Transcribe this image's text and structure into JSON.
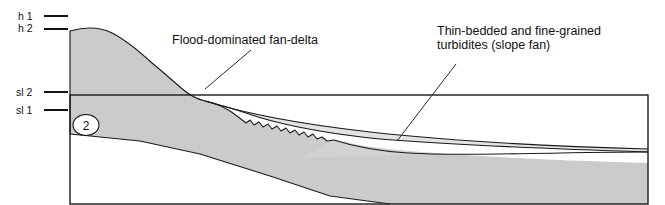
{
  "figure": {
    "width": 665,
    "height": 205,
    "background": "#ffffff"
  },
  "axis_labels": [
    {
      "id": "h1",
      "text": "h 1",
      "text_x": 18,
      "text_y": 20,
      "tick_x1": 44,
      "tick_x2": 68,
      "tick_y": 16
    },
    {
      "id": "h2",
      "text": "h 2",
      "text_x": 18,
      "text_y": 32,
      "tick_x1": 44,
      "tick_x2": 68,
      "tick_y": 29
    },
    {
      "id": "sl2",
      "text": "sl 2",
      "text_x": 16,
      "text_y": 96,
      "tick_x1": 44,
      "tick_x2": 68,
      "tick_y": 92
    },
    {
      "id": "sl1",
      "text": "sl 1",
      "text_x": 16,
      "text_y": 114,
      "tick_x1": 44,
      "tick_x2": 68,
      "tick_y": 110
    }
  ],
  "annotations": [
    {
      "id": "fan-delta",
      "lines": [
        "Flood-dominated fan-delta"
      ],
      "x": 172,
      "y": 44,
      "leader": {
        "x1": 251,
        "y1": 50,
        "x2": 205,
        "y2": 89
      }
    },
    {
      "id": "slope-fan",
      "lines": [
        "Thin-bedded and fine-grained",
        "turbidites (slope fan)"
      ],
      "x": 437,
      "y": 35,
      "leader": {
        "x1": 456,
        "y1": 64,
        "x2": 397,
        "y2": 141
      }
    }
  ],
  "stage_marker": {
    "label": "2",
    "cx": 86,
    "cy": 125,
    "rx": 13,
    "ry": 10.5
  },
  "sea_box": {
    "x": 70,
    "y": 95,
    "width": 578,
    "height": 109
  },
  "colors": {
    "basement_fill": "#cbcbcb",
    "fan_delta_fill": "#ffffff",
    "slope_fan_fill": "#e3e3e3",
    "lower_wedge_fill": "#d2d2d2",
    "outline": "#1a1a1a",
    "text": "#111111"
  },
  "geometry": {
    "basement": "M 70,31 C 84,27 100,27 112,33 C 126,40 140,52 152,63 C 163,72 172,80 180,87 C 189,95 196,99 205,101 C 214,103 222,106 230,111 C 236,115 241,119 246,123 L 250,120 L 254,125 L 259,122 L 263,127 L 268,124 L 272,129 L 277,126 L 281,131 L 286,128 L 290,133 L 295,130 L 299,135 L 304,132 L 308,137 L 313,134 L 317,139 L 322,137 L 327,141 L 334,140 L 345,142 L 360,145 L 380,148 L 410,151 L 450,154 L 500,157 L 560,160 L 648,163 L 648,204 L 390,204 L 330,196 L 270,176 L 200,154 L 140,141 L 70,134 Z",
    "fan_delta": "M 205,101 C 222,105 240,111 258,117 C 288,126 330,134 380,139 C 440,144 520,148 648,152 L 648,163 L 560,160 L 500,157 L 450,154 L 410,151 L 380,148 L 360,145 L 345,142 L 334,140 L 327,141 L 322,137 L 317,139 L 313,134 L 308,137 L 304,132 L 299,135 L 295,130 L 290,133 L 286,128 L 281,131 L 277,126 L 272,129 L 268,124 L 263,127 L 259,122 L 254,125 L 250,120 L 246,123 C 241,119 236,115 230,111 C 222,106 214,103 205,101 Z",
    "slope_fan": "M 205,101 C 240,112 300,124 370,132 C 450,141 540,146 648,149 L 648,152 C 520,148 440,144 380,139 C 330,134 288,126 258,117 C 240,111 222,105 205,101 Z",
    "lower_wedge": "M 300,158 C 340,156 400,155 470,154 C 540,153 600,152 648,152 L 648,163 L 560,160 L 500,157 L 450,154 L 410,151 L 380,148 L 360,145 L 345,142 L 334,140 Z",
    "layer_line_upper": "M 205,101 C 240,112 300,124 370,132 C 450,141 540,146 648,149",
    "layer_line_mid": "M 205,101 C 222,105 240,111 258,117 C 288,126 330,134 380,139 C 440,144 520,148 648,152",
    "layer_line_lower": "M 334,140 C 380,155 430,155 500,154 C 560,153 610,152 648,152",
    "basement_top": "M 70,31 C 84,27 100,27 112,33 C 126,40 140,52 152,63 C 163,72 172,80 180,87 C 189,95 196,99 205,101",
    "basement_step": "M 205,101 C 214,103 222,106 230,111 C 236,115 241,119 246,123 L 250,120 L 254,125 L 259,122 L 263,127 L 268,124 L 272,129 L 277,126 L 281,131 L 286,128 L 290,133 L 295,130 L 299,135 L 304,132 L 308,137 L 313,134 L 317,139 L 322,137 L 327,141 L 334,140",
    "basement_base": "M 70,134 L 140,141 L 200,154 L 270,176 L 330,196 L 390,204",
    "basement_left_edge": "M 70,31 L 70,134"
  }
}
